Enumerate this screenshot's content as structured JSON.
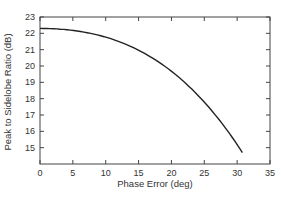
{
  "chart_data": {
    "type": "line",
    "title": "",
    "xlabel": "Phase Error (deg)",
    "ylabel": "Peak to Sidelobe Ratio (dB)",
    "xlim": [
      0,
      35
    ],
    "ylim": [
      14,
      23
    ],
    "xticks": [
      0,
      5,
      10,
      15,
      20,
      25,
      30,
      35
    ],
    "yticks": [
      15,
      16,
      17,
      18,
      19,
      20,
      21,
      22,
      23
    ],
    "grid": false,
    "legend": null,
    "series": [
      {
        "name": "Peak to Sidelobe Ratio",
        "x": [
          0,
          2.5,
          5,
          7.5,
          10,
          12.5,
          15,
          17.5,
          20,
          22.5,
          25,
          27.5,
          30,
          30.8
        ],
        "y": [
          22.3,
          22.25,
          22.15,
          22.0,
          21.8,
          21.55,
          21.25,
          20.9,
          20.5,
          20.0,
          19.4,
          18.7,
          17.9,
          14.7
        ]
      }
    ]
  },
  "axis": {
    "x_label": "Phase Error (deg)",
    "y_label": "Peak to Sidelobe Ratio (dB)"
  }
}
